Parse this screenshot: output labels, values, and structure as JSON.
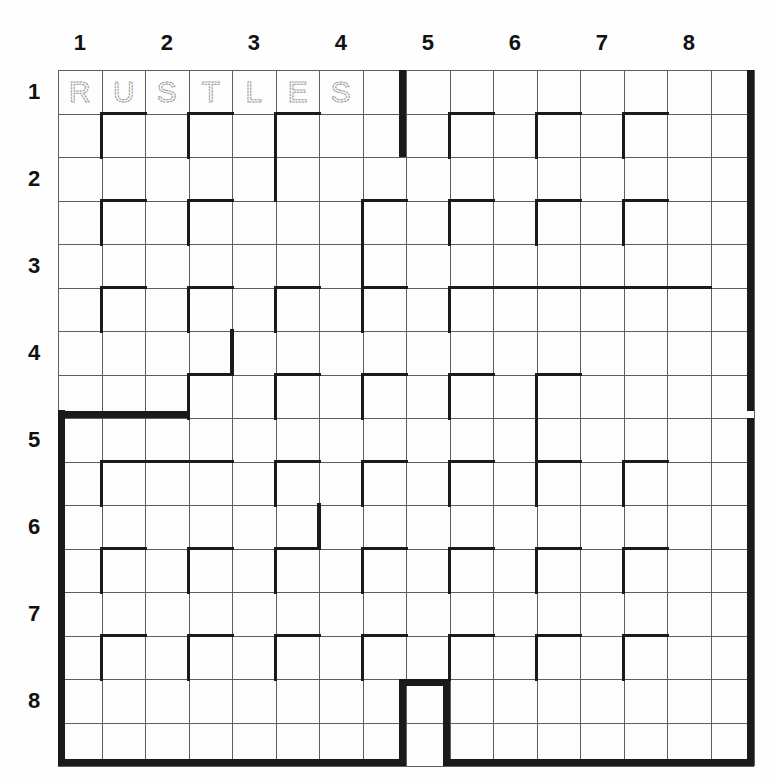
{
  "puzzle": {
    "type": "maze-grid",
    "title": "",
    "grid": {
      "cols": 16,
      "rows": 16,
      "cell_px": 43.5
    },
    "column_labels": [
      "1",
      "2",
      "3",
      "4",
      "5",
      "6",
      "7",
      "8"
    ],
    "row_labels": [
      "1",
      "2",
      "3",
      "4",
      "5",
      "6",
      "7",
      "8"
    ],
    "answer_row": {
      "row_index": 0,
      "letters": [
        "R",
        "U",
        "S",
        "T",
        "L",
        "E",
        "S"
      ],
      "word": "RUSTLES",
      "style": "dotted-outline"
    },
    "colors": {
      "wall": "#1a1a1a",
      "gridline": "#5e5e5e",
      "cell_fill": "#fdfdfd",
      "page": "#fefefe",
      "label_text": "#111111",
      "letter_stroke": "#9a9a9a"
    },
    "outer_border": {
      "style": "heavy-with-notches",
      "note": "grid is divided into four quadrant blocks separated by narrow gaps"
    },
    "horizontal_walls": [
      [
        1,
        1
      ],
      [
        3,
        1
      ],
      [
        5,
        1
      ],
      [
        9,
        1
      ],
      [
        11,
        1
      ],
      [
        13,
        1
      ],
      [
        1,
        3
      ],
      [
        3,
        3
      ],
      [
        7,
        3
      ],
      [
        9,
        3
      ],
      [
        11,
        3
      ],
      [
        13,
        3
      ],
      [
        1,
        5
      ],
      [
        3,
        5
      ],
      [
        5,
        5
      ],
      [
        7,
        5
      ],
      [
        9,
        5
      ],
      [
        10,
        5
      ],
      [
        11,
        5
      ],
      [
        12,
        5
      ],
      [
        13,
        5
      ],
      [
        14,
        5
      ],
      [
        3,
        7
      ],
      [
        5,
        7
      ],
      [
        7,
        7
      ],
      [
        9,
        7
      ],
      [
        11,
        7
      ],
      [
        1,
        9
      ],
      [
        2,
        9
      ],
      [
        3,
        9
      ],
      [
        5,
        9
      ],
      [
        7,
        9
      ],
      [
        9,
        9
      ],
      [
        11,
        9
      ],
      [
        13,
        9
      ],
      [
        1,
        11
      ],
      [
        3,
        11
      ],
      [
        5,
        11
      ],
      [
        7,
        11
      ],
      [
        9,
        11
      ],
      [
        11,
        11
      ],
      [
        13,
        11
      ],
      [
        1,
        13
      ],
      [
        3,
        13
      ],
      [
        5,
        13
      ],
      [
        7,
        13
      ],
      [
        9,
        13
      ],
      [
        11,
        13
      ],
      [
        13,
        13
      ]
    ],
    "vertical_walls": [
      [
        1,
        1
      ],
      [
        3,
        1
      ],
      [
        5,
        1
      ],
      [
        5,
        2
      ],
      [
        9,
        1
      ],
      [
        11,
        1
      ],
      [
        13,
        1
      ],
      [
        1,
        3
      ],
      [
        3,
        3
      ],
      [
        7,
        3
      ],
      [
        7,
        4
      ],
      [
        9,
        3
      ],
      [
        11,
        3
      ],
      [
        13,
        3
      ],
      [
        1,
        5
      ],
      [
        3,
        5
      ],
      [
        4,
        6
      ],
      [
        5,
        5
      ],
      [
        7,
        5
      ],
      [
        9,
        5
      ],
      [
        3,
        7
      ],
      [
        5,
        7
      ],
      [
        7,
        7
      ],
      [
        9,
        7
      ],
      [
        11,
        7
      ],
      [
        1,
        9
      ],
      [
        5,
        9
      ],
      [
        7,
        9
      ],
      [
        9,
        9
      ],
      [
        11,
        9
      ],
      [
        11,
        8
      ],
      [
        13,
        9
      ],
      [
        1,
        11
      ],
      [
        3,
        11
      ],
      [
        5,
        11
      ],
      [
        6,
        10
      ],
      [
        7,
        11
      ],
      [
        9,
        11
      ],
      [
        11,
        11
      ],
      [
        13,
        11
      ],
      [
        1,
        13
      ],
      [
        3,
        13
      ],
      [
        5,
        13
      ],
      [
        7,
        13
      ],
      [
        9,
        13
      ],
      [
        11,
        13
      ],
      [
        13,
        13
      ]
    ]
  }
}
